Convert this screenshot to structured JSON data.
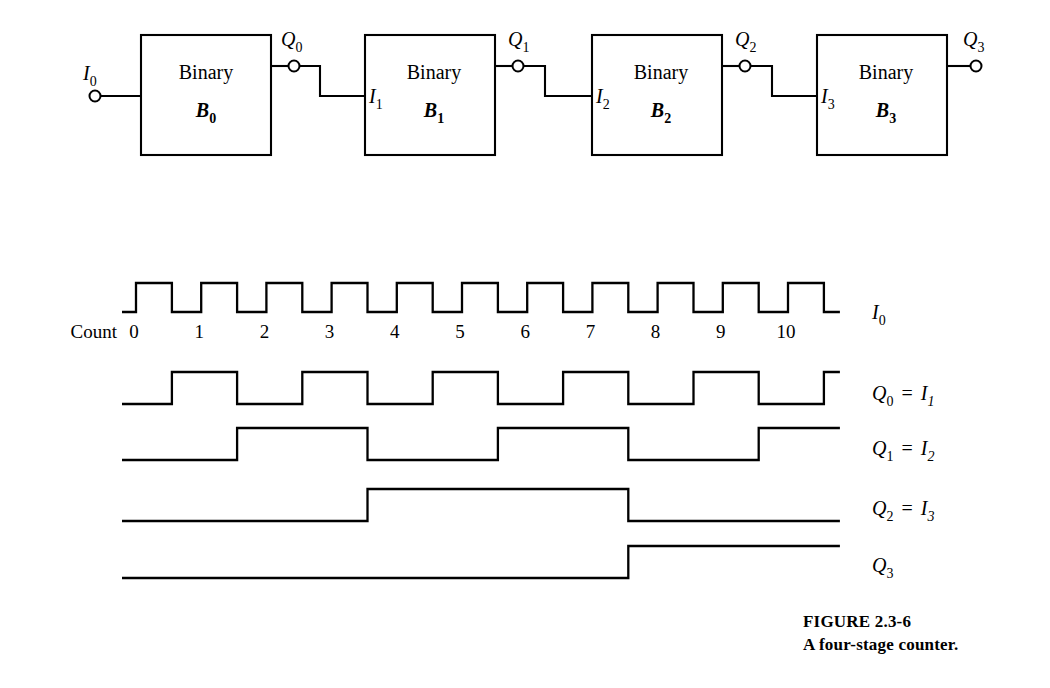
{
  "figure": {
    "caption_line1": "FIGURE 2.3-6",
    "caption_line2": "A four-stage counter.",
    "ink_color": "#000000",
    "paper_color": "#ffffff"
  },
  "block_diagram": {
    "stages": [
      {
        "title": "Binary",
        "name": "B",
        "name_sub": "0",
        "input_label": "I",
        "input_sub": "0",
        "output_label": "Q",
        "output_sub": "0",
        "show_input_label_outside": true,
        "show_input_label_inside": false
      },
      {
        "title": "Binary",
        "name": "B",
        "name_sub": "1",
        "input_label": "I",
        "input_sub": "1",
        "output_label": "Q",
        "output_sub": "1",
        "show_input_label_outside": false,
        "show_input_label_inside": true
      },
      {
        "title": "Binary",
        "name": "B",
        "name_sub": "2",
        "input_label": "I",
        "input_sub": "2",
        "output_label": "Q",
        "output_sub": "2",
        "show_input_label_outside": false,
        "show_input_label_inside": true
      },
      {
        "title": "Binary",
        "name": "B",
        "name_sub": "3",
        "input_label": "I",
        "input_sub": "3",
        "output_label": "Q",
        "output_sub": "3",
        "show_input_label_outside": false,
        "show_input_label_inside": true
      }
    ]
  },
  "timing_diagram": {
    "count_label": "Count",
    "count_ticks": [
      "0",
      "1",
      "2",
      "3",
      "4",
      "5",
      "6",
      "7",
      "8",
      "9",
      "10"
    ],
    "waveforms": [
      {
        "id": "I0",
        "label_main": "I",
        "label_sub": "0",
        "label_eq": "",
        "label_main2": "",
        "label_sub2": "",
        "period_in_counts": 1,
        "duty": 0.55,
        "start_high": false
      },
      {
        "id": "Q0",
        "label_main": "Q",
        "label_sub": "0",
        "label_eq": "=",
        "label_main2": "I",
        "label_sub2": "1",
        "period_in_counts": 2,
        "duty": 0.5,
        "start_high": false
      },
      {
        "id": "Q1",
        "label_main": "Q",
        "label_sub": "1",
        "label_eq": "=",
        "label_main2": "I",
        "label_sub2": "2",
        "period_in_counts": 4,
        "duty": 0.5,
        "start_high": false
      },
      {
        "id": "Q2",
        "label_main": "Q",
        "label_sub": "2",
        "label_eq": "=",
        "label_main2": "I",
        "label_sub2": "3",
        "period_in_counts": 8,
        "duty": 0.5,
        "start_high": false
      },
      {
        "id": "Q3",
        "label_main": "Q",
        "label_sub": "3",
        "label_eq": "",
        "label_main2": "",
        "label_sub2": "",
        "period_in_counts": 16,
        "duty": 0.5,
        "start_high": false
      }
    ]
  },
  "chart_data": {
    "type": "line",
    "xlabel": "Count",
    "ylabel": "",
    "x": [
      0,
      1,
      2,
      3,
      4,
      5,
      6,
      7,
      8,
      9,
      10
    ],
    "series": [
      {
        "name": "I0",
        "description": "Input clock pulse train, one pulse per count",
        "values": [
          1,
          1,
          1,
          1,
          1,
          1,
          1,
          1,
          1,
          1,
          1
        ],
        "levels_per_count": [
          [
            0,
            1
          ],
          [
            0,
            1
          ],
          [
            0,
            1
          ],
          [
            0,
            1
          ],
          [
            0,
            1
          ],
          [
            0,
            1
          ],
          [
            0,
            1
          ],
          [
            0,
            1
          ],
          [
            0,
            1
          ],
          [
            0,
            1
          ],
          [
            0,
            1
          ]
        ]
      },
      {
        "name": "Q0 = I1",
        "description": "Divide-by-2 of I0; toggles on each falling edge of I0",
        "values": [
          0,
          1,
          0,
          1,
          0,
          1,
          0,
          1,
          0,
          1,
          0
        ]
      },
      {
        "name": "Q1 = I2",
        "description": "Divide-by-4 of I0",
        "values": [
          0,
          0,
          1,
          1,
          0,
          0,
          1,
          1,
          0,
          0,
          1
        ]
      },
      {
        "name": "Q2 = I3",
        "description": "Divide-by-8 of I0",
        "values": [
          0,
          0,
          0,
          0,
          1,
          1,
          1,
          1,
          0,
          0,
          0
        ]
      },
      {
        "name": "Q3",
        "description": "Divide-by-16 of I0",
        "values": [
          0,
          0,
          0,
          0,
          0,
          0,
          0,
          0,
          1,
          1,
          1
        ]
      }
    ],
    "legend_position": "right",
    "grid": false
  }
}
